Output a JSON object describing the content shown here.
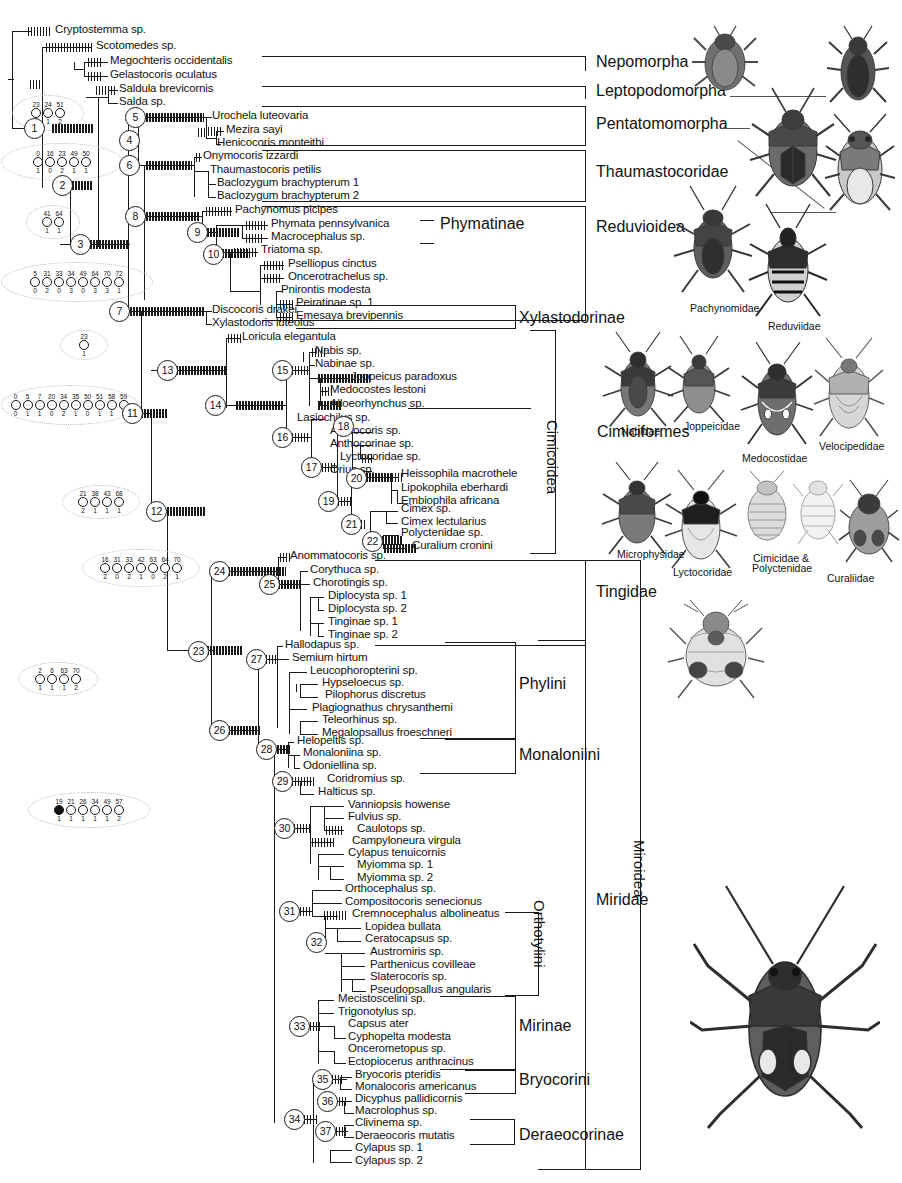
{
  "figure": {
    "type": "phylogenetic-cladogram"
  },
  "taxa": [
    {
      "name": "Cryptostemma sp.",
      "x": 55,
      "y": 31
    },
    {
      "name": "Scotomedes sp.",
      "x": 96,
      "y": 47
    },
    {
      "name": "Megochteris occidentalis",
      "x": 110,
      "y": 62
    },
    {
      "name": "Gelastocoris oculatus",
      "x": 110,
      "y": 76
    },
    {
      "name": "Saldula brevicornis",
      "x": 119,
      "y": 90
    },
    {
      "name": "Salda sp.",
      "x": 119,
      "y": 103
    },
    {
      "name": "Urochela luteovaria",
      "x": 212,
      "y": 117
    },
    {
      "name": "Mezira sayi",
      "x": 226,
      "y": 131
    },
    {
      "name": "Henicocoris monteithi",
      "x": 217,
      "y": 144
    },
    {
      "name": "Onymocoris izzardi",
      "x": 203,
      "y": 157
    },
    {
      "name": "Thaumastocoris petilis",
      "x": 210,
      "y": 171
    },
    {
      "name": "Baclozygum brachypterum 1",
      "x": 217,
      "y": 184
    },
    {
      "name": "Baclozygum brachypterum 2",
      "x": 217,
      "y": 197
    },
    {
      "name": "Pachynomus picipes",
      "x": 235,
      "y": 211
    },
    {
      "name": "Phymata pennsylvanica",
      "x": 271,
      "y": 225
    },
    {
      "name": "Macrocephalus sp.",
      "x": 271,
      "y": 238
    },
    {
      "name": "Triatoma sp.",
      "x": 261,
      "y": 251
    },
    {
      "name": "Pselliopus cinctus",
      "x": 288,
      "y": 265
    },
    {
      "name": "Oncerotrachelus sp.",
      "x": 288,
      "y": 278
    },
    {
      "name": "Pnirontis modesta",
      "x": 281,
      "y": 291
    },
    {
      "name": "Peiratinae sp. 1",
      "x": 296,
      "y": 304
    },
    {
      "name": "Emesaya brevipennis",
      "x": 296,
      "y": 317
    },
    {
      "name": "Discocoris drakei",
      "x": 212,
      "y": 311
    },
    {
      "name": "Xylastodoris luteolus",
      "x": 212,
      "y": 324
    },
    {
      "name": "Loricula elegantula",
      "x": 242,
      "y": 338
    },
    {
      "name": "Nabis sp.",
      "x": 315,
      "y": 352
    },
    {
      "name": "Nabinae sp.",
      "x": 315,
      "y": 365
    },
    {
      "name": "Joppeicus paradoxus",
      "x": 351,
      "y": 378
    },
    {
      "name": "Medocostes lestoni",
      "x": 330,
      "y": 391
    },
    {
      "name": "Alloeorhynchus sp.",
      "x": 330,
      "y": 405
    },
    {
      "name": "Lasiochilus sp.",
      "x": 297,
      "y": 419
    },
    {
      "name": "Anthocoris sp.",
      "x": 330,
      "y": 432
    },
    {
      "name": "Anthocorinae sp.",
      "x": 330,
      "y": 445
    },
    {
      "name": "Lyctocoridae sp.",
      "x": 340,
      "y": 458
    },
    {
      "name": "Orius sp.",
      "x": 330,
      "y": 471
    },
    {
      "name": "Heissophila macrothele",
      "x": 401,
      "y": 475
    },
    {
      "name": "Lipokophila eberhardi",
      "x": 401,
      "y": 489
    },
    {
      "name": "Embiophila africana",
      "x": 401,
      "y": 502
    },
    {
      "name": "Cimex sp.",
      "x": 401,
      "y": 510
    },
    {
      "name": "Cimex lectularius",
      "x": 401,
      "y": 523
    },
    {
      "name": "Polyctenidae sp.",
      "x": 401,
      "y": 534
    },
    {
      "name": "Curalium cronini",
      "x": 412,
      "y": 547
    },
    {
      "name": "Anommatocoris sp.",
      "x": 290,
      "y": 557
    },
    {
      "name": "Corythuca sp.",
      "x": 310,
      "y": 571
    },
    {
      "name": "Chorotingis sp.",
      "x": 313,
      "y": 584
    },
    {
      "name": "Diplocysta sp. 1",
      "x": 328,
      "y": 597
    },
    {
      "name": "Diplocysta sp. 2",
      "x": 328,
      "y": 610
    },
    {
      "name": "Tinginae sp. 1",
      "x": 328,
      "y": 623
    },
    {
      "name": "Tinginae sp. 2",
      "x": 328,
      "y": 636
    },
    {
      "name": "Hallodapus sp.",
      "x": 285,
      "y": 646
    },
    {
      "name": "Semium hirtum",
      "x": 292,
      "y": 659
    },
    {
      "name": "Leucophoropterini sp.",
      "x": 310,
      "y": 672
    },
    {
      "name": "Hypseloecus sp.",
      "x": 322,
      "y": 684
    },
    {
      "name": "Pilophorus discretus",
      "x": 325,
      "y": 696
    },
    {
      "name": "Plagiognathus chrysanthemi",
      "x": 312,
      "y": 709
    },
    {
      "name": "Teleorhinus sp.",
      "x": 322,
      "y": 721
    },
    {
      "name": "Megalopsallus froeschneri",
      "x": 322,
      "y": 734
    },
    {
      "name": "Helopeltis sp.",
      "x": 297,
      "y": 742
    },
    {
      "name": "Monaloniina sp.",
      "x": 303,
      "y": 754
    },
    {
      "name": "Odoniellina sp.",
      "x": 303,
      "y": 767
    },
    {
      "name": "Coridromius sp.",
      "x": 327,
      "y": 780
    },
    {
      "name": "Halticus sp.",
      "x": 318,
      "y": 793
    },
    {
      "name": "Vanniopsis howense",
      "x": 348,
      "y": 806
    },
    {
      "name": "Fulvius sp.",
      "x": 348,
      "y": 818
    },
    {
      "name": "Caulotops sp.",
      "x": 357,
      "y": 830
    },
    {
      "name": "Campyloneura virgula",
      "x": 352,
      "y": 842
    },
    {
      "name": "Cylapus tenuicornis",
      "x": 348,
      "y": 854
    },
    {
      "name": "Myiomma sp. 1",
      "x": 357,
      "y": 866
    },
    {
      "name": "Myiomma sp. 2",
      "x": 357,
      "y": 879
    },
    {
      "name": "Orthocephalus sp.",
      "x": 345,
      "y": 890
    },
    {
      "name": "Compositocoris senecionus",
      "x": 345,
      "y": 903
    },
    {
      "name": "Cremnocephalus albolineatus",
      "x": 352,
      "y": 915
    },
    {
      "name": "Lopidea bullata",
      "x": 365,
      "y": 928
    },
    {
      "name": "Ceratocapsus sp.",
      "x": 365,
      "y": 940
    },
    {
      "name": "Austromiris sp.",
      "x": 370,
      "y": 953
    },
    {
      "name": "Parthenicus covilleae",
      "x": 370,
      "y": 966
    },
    {
      "name": "Slaterocoris sp.",
      "x": 370,
      "y": 978
    },
    {
      "name": "Pseudopsallus angularis",
      "x": 370,
      "y": 991
    },
    {
      "name": "Mecistoscelini sp.",
      "x": 338,
      "y": 1000
    },
    {
      "name": "Trigonotylus sp.",
      "x": 338,
      "y": 1013
    },
    {
      "name": "Capsus ater",
      "x": 348,
      "y": 1025
    },
    {
      "name": "Cyphopelta modesta",
      "x": 348,
      "y": 1038
    },
    {
      "name": "Oncerometopus sp.",
      "x": 348,
      "y": 1050
    },
    {
      "name": "Ectopiocerus anthracinus",
      "x": 348,
      "y": 1063
    },
    {
      "name": "Bryocoris pteridis",
      "x": 355,
      "y": 1076
    },
    {
      "name": "Monalocoris americanus",
      "x": 355,
      "y": 1088
    },
    {
      "name": "Dicyphus pallidicornis",
      "x": 355,
      "y": 1100
    },
    {
      "name": "Macrolophus sp.",
      "x": 355,
      "y": 1112
    },
    {
      "name": "Clivinema sp.",
      "x": 355,
      "y": 1124
    },
    {
      "name": "Deraeocoris mutatis",
      "x": 355,
      "y": 1137
    },
    {
      "name": "Cylapus sp. 1",
      "x": 355,
      "y": 1149
    },
    {
      "name": "Cylapus sp. 2",
      "x": 355,
      "y": 1162
    }
  ],
  "nodes": [
    {
      "label": "1",
      "x": 33,
      "y": 127
    },
    {
      "label": "2",
      "x": 61,
      "y": 184
    },
    {
      "label": "3",
      "x": 79,
      "y": 243
    },
    {
      "label": "4",
      "x": 128,
      "y": 139
    },
    {
      "label": "5",
      "x": 134,
      "y": 116
    },
    {
      "label": "6",
      "x": 128,
      "y": 164
    },
    {
      "label": "7",
      "x": 118,
      "y": 310
    },
    {
      "label": "8",
      "x": 134,
      "y": 215
    },
    {
      "label": "9",
      "x": 196,
      "y": 231
    },
    {
      "label": "10",
      "x": 212,
      "y": 253
    },
    {
      "label": "11",
      "x": 131,
      "y": 412
    },
    {
      "label": "12",
      "x": 155,
      "y": 510
    },
    {
      "label": "13",
      "x": 166,
      "y": 369
    },
    {
      "label": "14",
      "x": 214,
      "y": 404
    },
    {
      "label": "15",
      "x": 281,
      "y": 369
    },
    {
      "label": "16",
      "x": 281,
      "y": 436
    },
    {
      "label": "17",
      "x": 310,
      "y": 466
    },
    {
      "label": "18",
      "x": 342,
      "y": 425
    },
    {
      "label": "19",
      "x": 327,
      "y": 500
    },
    {
      "label": "20",
      "x": 355,
      "y": 477
    },
    {
      "label": "21",
      "x": 350,
      "y": 523
    },
    {
      "label": "22",
      "x": 371,
      "y": 540
    },
    {
      "label": "23",
      "x": 197,
      "y": 650
    },
    {
      "label": "24",
      "x": 218,
      "y": 570
    },
    {
      "label": "25",
      "x": 268,
      "y": 583
    },
    {
      "label": "26",
      "x": 218,
      "y": 729
    },
    {
      "label": "27",
      "x": 255,
      "y": 658
    },
    {
      "label": "28",
      "x": 265,
      "y": 748
    },
    {
      "label": "29",
      "x": 281,
      "y": 780
    },
    {
      "label": "30",
      "x": 283,
      "y": 827
    },
    {
      "label": "31",
      "x": 288,
      "y": 910
    },
    {
      "label": "32",
      "x": 315,
      "y": 941
    },
    {
      "label": "33",
      "x": 298,
      "y": 1025
    },
    {
      "label": "34",
      "x": 293,
      "y": 1118
    },
    {
      "label": "35",
      "x": 321,
      "y": 1078
    },
    {
      "label": "36",
      "x": 326,
      "y": 1100
    },
    {
      "label": "37",
      "x": 324,
      "y": 1130
    }
  ],
  "balloons": [
    {
      "id": "b1",
      "x": 12,
      "y": 95,
      "w": 70,
      "h": 34,
      "chars": [
        {
          "num": "23",
          "val": "1",
          "filled": false
        },
        {
          "num": "24",
          "val": "1",
          "filled": false
        },
        {
          "num": "51",
          "val": "2",
          "filled": false
        }
      ]
    },
    {
      "id": "b2",
      "x": 1,
      "y": 143,
      "w": 120,
      "h": 36,
      "chars": [
        {
          "num": "0",
          "val": "1",
          "filled": false
        },
        {
          "num": "16",
          "val": "0",
          "filled": false
        },
        {
          "num": "23",
          "val": "2",
          "filled": false
        },
        {
          "num": "49",
          "val": "1",
          "filled": false
        },
        {
          "num": "50",
          "val": "1",
          "filled": false
        }
      ]
    },
    {
      "id": "b3",
      "x": 26,
      "y": 205,
      "w": 52,
      "h": 32,
      "chars": [
        {
          "num": "41",
          "val": "1",
          "filled": false
        },
        {
          "num": "64",
          "val": "1",
          "filled": false
        }
      ]
    },
    {
      "id": "b4",
      "x": 1,
      "y": 262,
      "w": 150,
      "h": 38,
      "chars": [
        {
          "num": "5",
          "val": "0",
          "filled": false
        },
        {
          "num": "31",
          "val": "2",
          "filled": false
        },
        {
          "num": "33",
          "val": "0",
          "filled": false
        },
        {
          "num": "34",
          "val": "3",
          "filled": false
        },
        {
          "num": "49",
          "val": "0",
          "filled": false
        },
        {
          "num": "64",
          "val": "3",
          "filled": false
        },
        {
          "num": "70",
          "val": "3",
          "filled": false
        },
        {
          "num": "72",
          "val": "1",
          "filled": false
        }
      ]
    },
    {
      "id": "b5",
      "x": 60,
      "y": 330,
      "w": 46,
      "h": 28,
      "chars": [
        {
          "num": "23",
          "val": "1",
          "filled": false
        }
      ]
    },
    {
      "id": "b6",
      "x": 1,
      "y": 385,
      "w": 135,
      "h": 38,
      "chars": [
        {
          "num": "0",
          "val": "0",
          "filled": false
        },
        {
          "num": "5",
          "val": "1",
          "filled": false
        },
        {
          "num": "7",
          "val": "1",
          "filled": false
        },
        {
          "num": "20",
          "val": "0",
          "filled": false
        },
        {
          "num": "34",
          "val": "2",
          "filled": false
        },
        {
          "num": "35",
          "val": "1",
          "filled": false
        },
        {
          "num": "50",
          "val": "0",
          "filled": false
        },
        {
          "num": "51",
          "val": "1",
          "filled": false
        },
        {
          "num": "58",
          "val": "1",
          "filled": false
        },
        {
          "num": "59",
          "val": "1",
          "filled": false
        }
      ]
    },
    {
      "id": "b7",
      "x": 62,
      "y": 485,
      "w": 76,
      "h": 32,
      "chars": [
        {
          "num": "21",
          "val": "2",
          "filled": false
        },
        {
          "num": "38",
          "val": "1",
          "filled": false
        },
        {
          "num": "43",
          "val": "1",
          "filled": false
        },
        {
          "num": "68",
          "val": "1",
          "filled": false
        }
      ]
    },
    {
      "id": "b8",
      "x": 82,
      "y": 549,
      "w": 116,
      "h": 36,
      "chars": [
        {
          "num": "16",
          "val": "2",
          "filled": false
        },
        {
          "num": "31",
          "val": "0",
          "filled": false
        },
        {
          "num": "33",
          "val": "2",
          "filled": false
        },
        {
          "num": "42",
          "val": "1",
          "filled": false
        },
        {
          "num": "63",
          "val": "0",
          "filled": false
        },
        {
          "num": "64",
          "val": "2",
          "filled": false
        },
        {
          "num": "70",
          "val": "1",
          "filled": false
        }
      ]
    },
    {
      "id": "b9",
      "x": 18,
      "y": 662,
      "w": 78,
      "h": 32,
      "chars": [
        {
          "num": "2",
          "val": "1",
          "filled": false
        },
        {
          "num": "6",
          "val": "1",
          "filled": false
        },
        {
          "num": "63",
          "val": "1",
          "filled": false
        },
        {
          "num": "70",
          "val": "2",
          "filled": false
        }
      ]
    },
    {
      "id": "b10",
      "x": 28,
      "y": 792,
      "w": 120,
      "h": 34,
      "chars": [
        {
          "num": "19",
          "val": "1",
          "filled": true
        },
        {
          "num": "21",
          "val": "1",
          "filled": false
        },
        {
          "num": "26",
          "val": "1",
          "filled": false
        },
        {
          "num": "34",
          "val": "1",
          "filled": false
        },
        {
          "num": "49",
          "val": "1",
          "filled": false
        },
        {
          "num": "57",
          "val": "2",
          "filled": false
        }
      ]
    }
  ],
  "clade_labels": [
    {
      "text": "Nepomorpha",
      "x": 596,
      "y": 62,
      "size": "big"
    },
    {
      "text": "Leptopodomorpha",
      "x": 596,
      "y": 91,
      "size": "big"
    },
    {
      "text": "Pentatomomorpha",
      "x": 596,
      "y": 124,
      "size": "big"
    },
    {
      "text": "Thaumastocoridae",
      "x": 596,
      "y": 172,
      "size": "big"
    },
    {
      "text": "Reduvioidea",
      "x": 596,
      "y": 227,
      "size": "big"
    },
    {
      "text": "Phymatinae",
      "x": 440,
      "y": 224,
      "size": "big"
    },
    {
      "text": "Xylastodorinae",
      "x": 519,
      "y": 318,
      "size": "big"
    },
    {
      "text": "Tingidae",
      "x": 596,
      "y": 592,
      "size": "big"
    },
    {
      "text": "Phylini",
      "x": 519,
      "y": 684,
      "size": "big"
    },
    {
      "text": "Monaloniini",
      "x": 519,
      "y": 755,
      "size": "big"
    },
    {
      "text": "Orthotylini",
      "x": 548,
      "y": 900,
      "size": "big",
      "vertical": true
    },
    {
      "text": "Mirinae",
      "x": 519,
      "y": 1026,
      "size": "big"
    },
    {
      "text": "Bryocorini",
      "x": 519,
      "y": 1080,
      "size": "big"
    },
    {
      "text": "Deraeocorinae",
      "x": 519,
      "y": 1135,
      "size": "big"
    },
    {
      "text": "Cimicoidea",
      "x": 561,
      "y": 420,
      "size": "big",
      "vertical": true
    },
    {
      "text": "Miridae",
      "x": 596,
      "y": 900,
      "size": "big"
    },
    {
      "text": "Miroidea",
      "x": 648,
      "y": 840,
      "size": "big",
      "vertical": true
    },
    {
      "text": "Cimiciformes",
      "x": 597,
      "y": 432,
      "size": "big"
    }
  ],
  "figure_captions": [
    {
      "text": "Pachynomidae",
      "x": 690,
      "y": 302
    },
    {
      "text": "Reduviidae",
      "x": 768,
      "y": 320
    },
    {
      "text": "Nabidae",
      "x": 621,
      "y": 425
    },
    {
      "text": "Joppeicidae",
      "x": 684,
      "y": 420
    },
    {
      "text": "Medocostidae",
      "x": 742,
      "y": 452
    },
    {
      "text": "Velocipedidae",
      "x": 819,
      "y": 440
    },
    {
      "text": "Microphysidae",
      "x": 617,
      "y": 548
    },
    {
      "text": "Lyctocoridae",
      "x": 673,
      "y": 566
    },
    {
      "text": "Cimicidae &",
      "x": 753,
      "y": 552
    },
    {
      "text": "Polyctenidae",
      "x": 752,
      "y": 562
    },
    {
      "text": "Curaliidae",
      "x": 827,
      "y": 572
    }
  ],
  "colors": {
    "ink": "#1a1a1a",
    "balloon_outline": "#b9b9b9",
    "background": "#ffffff",
    "bug_dark": "#3a3a3a",
    "bug_mid": "#7d7d7d",
    "bug_light": "#b5b5b5"
  }
}
